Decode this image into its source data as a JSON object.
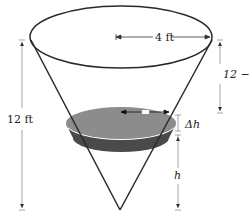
{
  "figure": {
    "labels": {
      "top_radius": "4 ft",
      "total_height": "12 ft",
      "remaining_height": "12 − h",
      "slice_thickness": "Δh",
      "slice_height": "h",
      "slice_radius": "r"
    },
    "colors": {
      "outline": "#2a2a2a",
      "dimension_line": "#9a9a9a",
      "water_top": "#8c8c8c",
      "water_side": "#4a4a4a",
      "background": "#ffffff"
    }
  }
}
